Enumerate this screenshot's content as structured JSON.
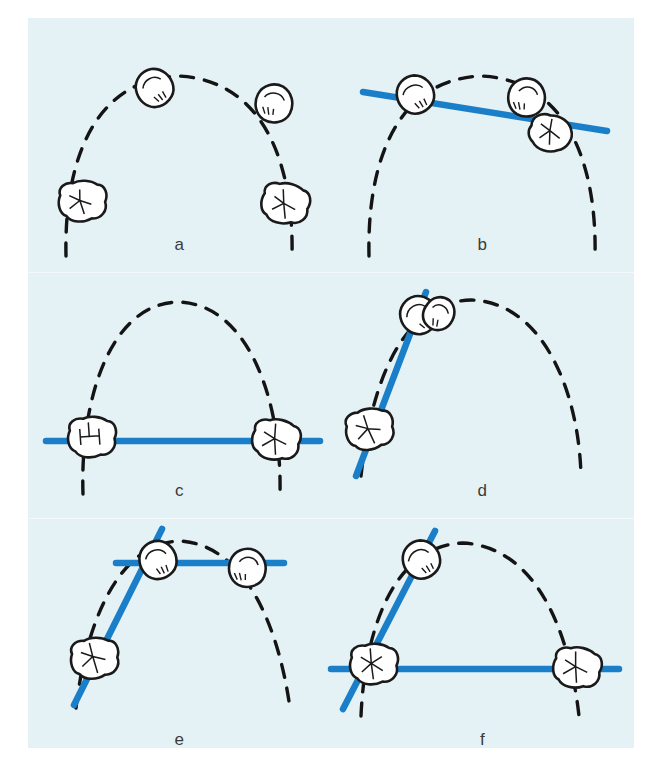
{
  "figure": {
    "background_color": "#e4f2f5",
    "page_color": "#ffffff",
    "line_color": "#1a7fc8",
    "arch_color": "#111111",
    "tooth_fill": "#ffffff",
    "tooth_stroke": "#1a1a1a",
    "panel_count": 6
  },
  "panels": [
    {
      "id": "a",
      "label": "a",
      "description": "Dental arch with four teeth, no reference line",
      "has_blue_line": false,
      "blue_lines": [],
      "teeth": [
        {
          "type": "premolar",
          "position": "upper-left"
        },
        {
          "type": "premolar",
          "position": "upper-right"
        },
        {
          "type": "molar",
          "position": "lower-left"
        },
        {
          "type": "molar",
          "position": "lower-right"
        }
      ]
    },
    {
      "id": "b",
      "label": "b",
      "description": "Slightly tilted reference line through premolars and right molar",
      "has_blue_line": true,
      "blue_lines": [
        {
          "orientation": "tilted-horizontal"
        }
      ],
      "teeth": [
        {
          "type": "premolar",
          "position": "upper-left"
        },
        {
          "type": "premolar",
          "position": "upper-right"
        },
        {
          "type": "molar",
          "position": "right"
        }
      ]
    },
    {
      "id": "c",
      "label": "c",
      "description": "Horizontal reference line through both molars",
      "has_blue_line": true,
      "blue_lines": [
        {
          "orientation": "horizontal"
        }
      ],
      "teeth": [
        {
          "type": "molar",
          "position": "left"
        },
        {
          "type": "molar",
          "position": "right"
        }
      ]
    },
    {
      "id": "d",
      "label": "d",
      "description": "Steep reference line along left segment through premolar and molar",
      "has_blue_line": true,
      "blue_lines": [
        {
          "orientation": "diagonal-left"
        }
      ],
      "teeth": [
        {
          "type": "premolar",
          "position": "upper"
        },
        {
          "type": "premolar",
          "position": "upper-adjacent"
        },
        {
          "type": "molar",
          "position": "lower-left"
        }
      ]
    },
    {
      "id": "e",
      "label": "e",
      "description": "Horizontal line through premolars plus diagonal line through left segment",
      "has_blue_line": true,
      "blue_lines": [
        {
          "orientation": "horizontal"
        },
        {
          "orientation": "diagonal-left"
        }
      ],
      "teeth": [
        {
          "type": "premolar",
          "position": "upper-left"
        },
        {
          "type": "premolar",
          "position": "upper-right"
        },
        {
          "type": "molar",
          "position": "lower-left"
        }
      ]
    },
    {
      "id": "f",
      "label": "f",
      "description": "Horizontal line through both molars plus diagonal line through left segment",
      "has_blue_line": true,
      "blue_lines": [
        {
          "orientation": "horizontal"
        },
        {
          "orientation": "diagonal-left"
        }
      ],
      "teeth": [
        {
          "type": "premolar",
          "position": "upper-left"
        },
        {
          "type": "molar",
          "position": "lower-left"
        },
        {
          "type": "molar",
          "position": "lower-right"
        }
      ]
    }
  ]
}
